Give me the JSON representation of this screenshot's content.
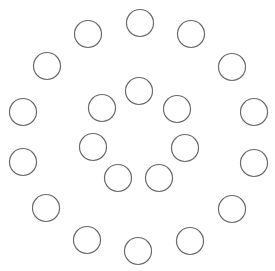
{
  "diagram": {
    "width": 275,
    "height": 271,
    "background": "#ffffff",
    "stroke_color": "#6a6a6a",
    "stroke_width": 1.2,
    "radius": 13.5,
    "outer_ring": [
      {
        "x": 140,
        "y": 23
      },
      {
        "x": 191,
        "y": 34
      },
      {
        "x": 232,
        "y": 67
      },
      {
        "x": 254,
        "y": 112
      },
      {
        "x": 254,
        "y": 163
      },
      {
        "x": 232,
        "y": 209
      },
      {
        "x": 190,
        "y": 241
      },
      {
        "x": 138,
        "y": 251
      },
      {
        "x": 87,
        "y": 240
      },
      {
        "x": 46,
        "y": 208
      },
      {
        "x": 23,
        "y": 162
      },
      {
        "x": 23,
        "y": 112
      },
      {
        "x": 47,
        "y": 66
      },
      {
        "x": 88,
        "y": 34
      }
    ],
    "inner_ring": [
      {
        "x": 139,
        "y": 91
      },
      {
        "x": 177,
        "y": 109
      },
      {
        "x": 185,
        "y": 148
      },
      {
        "x": 159,
        "y": 178
      },
      {
        "x": 118,
        "y": 178
      },
      {
        "x": 93,
        "y": 147
      },
      {
        "x": 102,
        "y": 108
      }
    ]
  }
}
